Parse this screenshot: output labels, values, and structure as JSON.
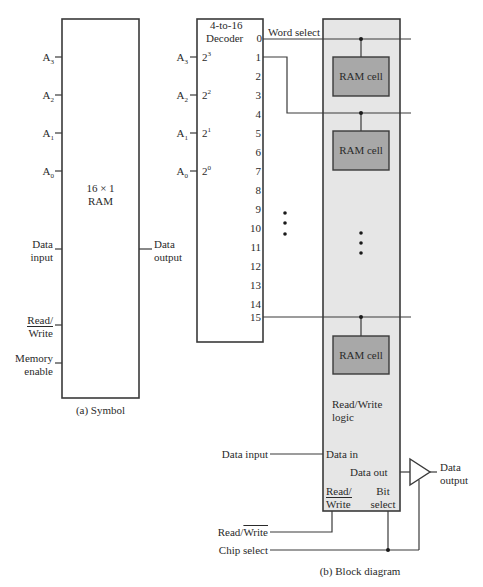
{
  "symbol": {
    "title_line1": "16 × 1",
    "title_line2": "RAM",
    "address_inputs": [
      {
        "base": "A",
        "sub": "3"
      },
      {
        "base": "A",
        "sub": "2"
      },
      {
        "base": "A",
        "sub": "1"
      },
      {
        "base": "A",
        "sub": "0"
      }
    ],
    "data_input_line1": "Data",
    "data_input_line2": "input",
    "data_output_line1": "Data",
    "data_output_line2": "output",
    "read_write_line1": "Read/",
    "read_write_line2": "Write",
    "memory_enable_line1": "Memory",
    "memory_enable_line2": "enable",
    "caption": "(a) Symbol"
  },
  "decoder": {
    "title_line1": "4-to-16",
    "title_line2": "Decoder",
    "inputs": [
      {
        "addr_base": "A",
        "addr_sub": "3",
        "weight_base": "2",
        "weight_exp": "3"
      },
      {
        "addr_base": "A",
        "addr_sub": "2",
        "weight_base": "2",
        "weight_exp": "2"
      },
      {
        "addr_base": "A",
        "addr_sub": "1",
        "weight_base": "2",
        "weight_exp": "1"
      },
      {
        "addr_base": "A",
        "addr_sub": "0",
        "weight_base": "2",
        "weight_exp": "0"
      }
    ],
    "outputs": [
      "0",
      "1",
      "2",
      "3",
      "4",
      "5",
      "6",
      "7",
      "8",
      "9",
      "10",
      "11",
      "12",
      "13",
      "14",
      "15"
    ],
    "word_select": "Word select"
  },
  "array": {
    "cells": [
      "RAM cell",
      "RAM cell",
      "RAM cell"
    ],
    "rw_logic_line1": "Read/Write",
    "rw_logic_line2": "logic",
    "data_in": "Data in",
    "data_out": "Data out",
    "rw_pin_line1": "Read/",
    "rw_pin_line2": "Write",
    "bit_select_line1": "Bit",
    "bit_select_line2": "select"
  },
  "block_io": {
    "data_input": "Data input",
    "read_write_prefix": "Read/",
    "read_write_bar": "Write",
    "chip_select": "Chip select",
    "data_output_line1": "Data",
    "data_output_line2": "output",
    "caption": "(b) Block diagram"
  },
  "colors": {
    "line": "#3a3a3a",
    "array_fill": "#e6e6e6",
    "cell_fill": "#a8a8a8"
  }
}
